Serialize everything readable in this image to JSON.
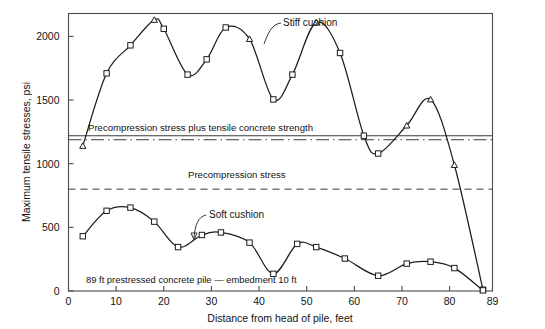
{
  "chart_data": {
    "type": "line",
    "title": "",
    "xlabel": "Distance from head of pile, feet",
    "ylabel": "Maximum tensile stresses, psi",
    "xlim": [
      0,
      89
    ],
    "ylim": [
      0,
      2180
    ],
    "xticks": [
      0,
      10,
      20,
      30,
      40,
      50,
      60,
      70,
      80,
      89
    ],
    "xticklabels": [
      "0",
      "10",
      "20",
      "30",
      "40",
      "50",
      "60",
      "70",
      "80",
      "89"
    ],
    "yticks": [
      0,
      500,
      1000,
      1500,
      2000
    ],
    "yticklabels": [
      "0",
      "500",
      "1000",
      "1500",
      "2000"
    ],
    "grid": false,
    "legend_position": "inline-annotations",
    "series": [
      {
        "name": "Stiff cushion",
        "marker": "triangle-and-square",
        "x": [
          3,
          8,
          13,
          18,
          20,
          25,
          29,
          33,
          38,
          43,
          47,
          52,
          57,
          62,
          65,
          71,
          76,
          81,
          87
        ],
        "y": [
          1140,
          1710,
          1930,
          2130,
          2060,
          1700,
          1820,
          2070,
          1980,
          1505,
          1700,
          2110,
          1870,
          1220,
          1080,
          1300,
          1505,
          990,
          10
        ]
      },
      {
        "name": "Soft cushion",
        "marker": "square",
        "x": [
          3,
          8,
          13,
          18,
          23,
          28,
          32,
          38,
          43,
          48,
          52,
          58,
          65,
          71,
          76,
          81,
          87
        ],
        "y": [
          430,
          630,
          655,
          545,
          345,
          440,
          460,
          380,
          135,
          370,
          345,
          255,
          120,
          215,
          230,
          180,
          5
        ]
      }
    ],
    "reference_lines": [
      {
        "label": "Precompression stress plus tensile concrete strength",
        "value": 1200,
        "style": "solid-over-dashdot"
      },
      {
        "label": "Precompression stress",
        "value": 800,
        "style": "dash-dot"
      }
    ],
    "annotations": [
      {
        "name": "stiff-cushion-label",
        "text": "Stiff cushion"
      },
      {
        "name": "soft-cushion-label",
        "text": "Soft cushion"
      },
      {
        "name": "pile-note",
        "text": "89 ft prestressed concrete pile — embedment 10 ft"
      }
    ],
    "colors": {
      "curve": "#1d1d1d",
      "axis": "#4a4a4a",
      "marker_fill": "#ffffff",
      "background": "#ffffff"
    }
  },
  "axes": {
    "x_title": "Distance from head of pile, feet",
    "y_title": "Maximum tensile stresses, psi",
    "x_tick_0": "0",
    "x_tick_10": "10",
    "x_tick_20": "20",
    "x_tick_30": "30",
    "x_tick_40": "40",
    "x_tick_50": "50",
    "x_tick_60": "60",
    "x_tick_70": "70",
    "x_tick_80": "80",
    "x_tick_89": "89",
    "y_tick_0": "0",
    "y_tick_500": "500",
    "y_tick_1000": "1000",
    "y_tick_1500": "1500",
    "y_tick_2000": "2000"
  },
  "labels": {
    "precompression_plus_tensile": "Precompression stress plus tensile concrete strength",
    "precompression": "Precompression stress",
    "stiff_cushion": "Stiff cushion",
    "soft_cushion": "Soft cushion",
    "pile_note": "89 ft prestressed concrete pile — embedment 10 ft"
  }
}
